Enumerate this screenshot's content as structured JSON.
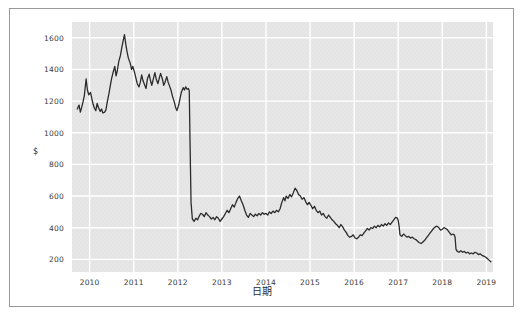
{
  "figure": {
    "background_color": "#ffffff",
    "frame_color": "#999999",
    "plot_background_color": "#e6e6e6",
    "grid_color": "#ffffff",
    "line_color": "#2b2b2b",
    "ylabel": "$",
    "xlabel": "日期"
  },
  "chart_data": {
    "type": "line",
    "title": "",
    "xlabel": "日期",
    "ylabel": "$",
    "xlim": [
      2009.6,
      2019.15
    ],
    "ylim": [
      120,
      1700
    ],
    "grid": true,
    "legend": null,
    "x_tick_labels": [
      "2010",
      "2011",
      "2012",
      "2013",
      "2014",
      "2015",
      "2016",
      "2017",
      "2018",
      "2019"
    ],
    "x_tick_values": [
      2010,
      2011,
      2012,
      2013,
      2014,
      2015,
      2016,
      2017,
      2018,
      2019
    ],
    "y_tick_labels": [
      "200",
      "400",
      "600",
      "800",
      "1000",
      "1200",
      "1400",
      "1600"
    ],
    "y_tick_values": [
      200,
      400,
      600,
      800,
      1000,
      1200,
      1400,
      1600
    ],
    "series": [
      {
        "name": "price",
        "color": "#2b2b2b",
        "x": [
          2009.72,
          2009.76,
          2009.79,
          2009.82,
          2009.85,
          2009.88,
          2009.92,
          2009.95,
          2009.98,
          2010.02,
          2010.05,
          2010.08,
          2010.11,
          2010.14,
          2010.17,
          2010.2,
          2010.24,
          2010.27,
          2010.3,
          2010.34,
          2010.37,
          2010.4,
          2010.44,
          2010.47,
          2010.5,
          2010.54,
          2010.57,
          2010.6,
          2010.63,
          2010.66,
          2010.7,
          2010.73,
          2010.76,
          2010.79,
          2010.82,
          2010.85,
          2010.88,
          2010.92,
          2010.95,
          2010.98,
          2011.02,
          2011.05,
          2011.08,
          2011.12,
          2011.15,
          2011.18,
          2011.21,
          2011.25,
          2011.28,
          2011.31,
          2011.35,
          2011.38,
          2011.41,
          2011.45,
          2011.48,
          2011.51,
          2011.55,
          2011.58,
          2011.61,
          2011.65,
          2011.68,
          2011.71,
          2011.75,
          2011.78,
          2011.82,
          2011.85,
          2011.88,
          2011.92,
          2011.95,
          2011.98,
          2012.02,
          2012.05,
          2012.08,
          2012.12,
          2012.15,
          2012.18,
          2012.21,
          2012.24,
          2012.26,
          2012.28,
          2012.3,
          2012.33,
          2012.37,
          2012.41,
          2012.45,
          2012.48,
          2012.52,
          2012.56,
          2012.6,
          2012.64,
          2012.68,
          2012.72,
          2012.76,
          2012.8,
          2012.84,
          2012.88,
          2012.92,
          2012.96,
          2013.0,
          2013.04,
          2013.08,
          2013.12,
          2013.16,
          2013.2,
          2013.24,
          2013.28,
          2013.32,
          2013.36,
          2013.4,
          2013.44,
          2013.48,
          2013.52,
          2013.56,
          2013.6,
          2013.64,
          2013.68,
          2013.72,
          2013.76,
          2013.8,
          2013.84,
          2013.88,
          2013.92,
          2013.96,
          2014.0,
          2014.04,
          2014.08,
          2014.12,
          2014.16,
          2014.2,
          2014.24,
          2014.28,
          2014.32,
          2014.36,
          2014.4,
          2014.43,
          2014.46,
          2014.5,
          2014.54,
          2014.58,
          2014.62,
          2014.66,
          2014.7,
          2014.74,
          2014.78,
          2014.82,
          2014.86,
          2014.9,
          2014.94,
          2014.98,
          2015.02,
          2015.06,
          2015.1,
          2015.14,
          2015.18,
          2015.22,
          2015.26,
          2015.3,
          2015.34,
          2015.38,
          2015.42,
          2015.46,
          2015.5,
          2015.54,
          2015.58,
          2015.62,
          2015.66,
          2015.7,
          2015.74,
          2015.78,
          2015.82,
          2015.86,
          2015.9,
          2015.94,
          2015.98,
          2016.02,
          2016.06,
          2016.1,
          2016.14,
          2016.18,
          2016.22,
          2016.26,
          2016.3,
          2016.34,
          2016.38,
          2016.42,
          2016.46,
          2016.5,
          2016.54,
          2016.58,
          2016.62,
          2016.66,
          2016.7,
          2016.74,
          2016.78,
          2016.82,
          2016.86,
          2016.9,
          2016.94,
          2016.98,
          2017.0,
          2017.02,
          2017.04,
          2017.08,
          2017.12,
          2017.16,
          2017.2,
          2017.24,
          2017.28,
          2017.32,
          2017.36,
          2017.4,
          2017.44,
          2017.48,
          2017.52,
          2017.56,
          2017.6,
          2017.64,
          2017.68,
          2017.72,
          2017.76,
          2017.8,
          2017.84,
          2017.88,
          2017.92,
          2017.96,
          2018.0,
          2018.04,
          2018.08,
          2018.12,
          2018.16,
          2018.2,
          2018.24,
          2018.27,
          2018.29,
          2018.31,
          2018.34,
          2018.38,
          2018.42,
          2018.46,
          2018.5,
          2018.54,
          2018.58,
          2018.62,
          2018.66,
          2018.7,
          2018.74,
          2018.78,
          2018.82,
          2018.86,
          2018.9,
          2018.94,
          2018.98,
          2019.02,
          2019.06,
          2019.1
        ],
        "y": [
          1150,
          1175,
          1130,
          1160,
          1195,
          1235,
          1340,
          1270,
          1240,
          1255,
          1215,
          1180,
          1155,
          1140,
          1185,
          1160,
          1135,
          1150,
          1125,
          1130,
          1145,
          1195,
          1250,
          1300,
          1345,
          1390,
          1420,
          1360,
          1395,
          1450,
          1490,
          1540,
          1580,
          1620,
          1560,
          1510,
          1470,
          1440,
          1400,
          1420,
          1380,
          1345,
          1310,
          1290,
          1320,
          1365,
          1330,
          1300,
          1280,
          1340,
          1370,
          1330,
          1300,
          1345,
          1380,
          1340,
          1310,
          1345,
          1375,
          1340,
          1300,
          1320,
          1355,
          1320,
          1290,
          1265,
          1230,
          1195,
          1160,
          1140,
          1175,
          1215,
          1255,
          1285,
          1270,
          1290,
          1275,
          1280,
          1265,
          900,
          560,
          455,
          440,
          460,
          450,
          470,
          490,
          485,
          470,
          495,
          480,
          470,
          455,
          465,
          450,
          470,
          460,
          440,
          455,
          470,
          490,
          510,
          495,
          520,
          545,
          530,
          560,
          585,
          600,
          570,
          545,
          510,
          480,
          465,
          490,
          480,
          470,
          485,
          475,
          490,
          480,
          495,
          485,
          490,
          480,
          500,
          490,
          505,
          495,
          510,
          500,
          520,
          560,
          590,
          570,
          600,
          585,
          610,
          595,
          620,
          650,
          635,
          610,
          600,
          580,
          590,
          565,
          545,
          560,
          540,
          520,
          535,
          510,
          495,
          505,
          480,
          490,
          470,
          460,
          480,
          465,
          450,
          440,
          425,
          415,
          400,
          420,
          405,
          385,
          370,
          350,
          340,
          345,
          355,
          335,
          330,
          340,
          355,
          350,
          365,
          380,
          395,
          385,
          400,
          395,
          410,
          400,
          415,
          405,
          420,
          410,
          425,
          415,
          430,
          420,
          435,
          450,
          465,
          460,
          445,
          410,
          355,
          345,
          360,
          350,
          340,
          345,
          335,
          340,
          330,
          325,
          315,
          305,
          300,
          310,
          320,
          335,
          350,
          365,
          380,
          395,
          405,
          410,
          400,
          385,
          390,
          400,
          395,
          385,
          370,
          355,
          360,
          355,
          340,
          265,
          250,
          245,
          255,
          245,
          250,
          240,
          245,
          235,
          240,
          235,
          245,
          240,
          230,
          235,
          225,
          220,
          215,
          205,
          195,
          185
        ]
      }
    ]
  }
}
